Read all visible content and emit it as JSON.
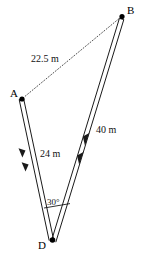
{
  "figure": {
    "type": "geometry-diagram",
    "background_color": "#ffffff",
    "stroke_color": "#1a1a1a",
    "vertices": [
      {
        "id": "A",
        "label": "A",
        "x": 22,
        "y": 99
      },
      {
        "id": "B",
        "label": "B",
        "x": 122,
        "y": 16
      },
      {
        "id": "D",
        "label": "D",
        "x": 52,
        "y": 240
      }
    ],
    "edges": [
      {
        "id": "AB",
        "from": "A",
        "to": "B",
        "style": "dotted",
        "measure_label": "22.5 m"
      },
      {
        "id": "AD",
        "from": "A",
        "to": "D",
        "style": "double-solid-with-arrows",
        "measure_label": "24 m"
      },
      {
        "id": "BD",
        "from": "B",
        "to": "D",
        "style": "double-solid-with-arrows",
        "measure_label": "40 m"
      }
    ],
    "angles": [
      {
        "id": "ADB",
        "at_vertex": "D",
        "label": "30°",
        "value": 30,
        "unit": "degrees"
      }
    ],
    "labels": {
      "vertex_a": "A",
      "vertex_b": "B",
      "vertex_d": "D",
      "length_ab": "22.5 m",
      "length_ad": "24 m",
      "length_bd": "40 m",
      "angle_d": "30°"
    }
  }
}
